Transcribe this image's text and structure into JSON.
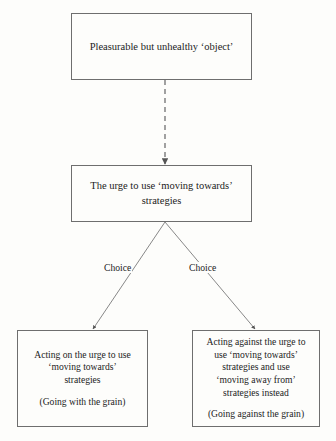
{
  "diagram": {
    "background_color": "#fdfdfb",
    "stroke_color": "#6e6e6e",
    "text_color": "#1c1c1c",
    "nodes": {
      "pleasurable_object": {
        "lines": [
          "Pleasurable but unhealthy ‘object’"
        ]
      },
      "urge_moving_towards": {
        "lines": [
          "The urge to use ‘moving towards’",
          "strategies"
        ]
      },
      "acting_on_urge": {
        "lines": [
          "Acting on the urge to use",
          "‘moving towards’",
          "strategies"
        ],
        "note": "(Going with the grain)"
      },
      "acting_against_urge": {
        "lines": [
          "Acting against the urge to",
          "use ‘moving towards’",
          "strategies and use",
          "‘moving away from’",
          "strategies instead"
        ],
        "note": "(Going against the grain)"
      }
    },
    "edges": {
      "object_to_urge": {
        "style": "dashed",
        "arrowhead": "filled-triangle",
        "label": ""
      },
      "urge_to_acting_on": {
        "style": "solid",
        "arrowhead": "filled-triangle",
        "label": "Choice"
      },
      "urge_to_acting_against": {
        "style": "solid",
        "arrowhead": "filled-triangle",
        "label": "Choice"
      }
    }
  }
}
